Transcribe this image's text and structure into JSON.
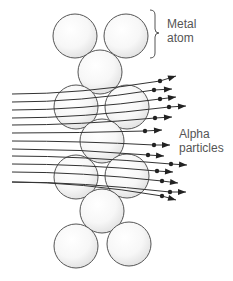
{
  "diagram": {
    "labels": {
      "metal_atom_line1": "Metal",
      "metal_atom_line2": "atom",
      "alpha_line1": "Alpha",
      "alpha_line2": "particles"
    },
    "colors": {
      "atom_stroke": "#555555",
      "atom_fill_light": "#ffffff",
      "atom_fill_shade": "#e6e6e6",
      "line": "#333333",
      "dot": "#222222",
      "text": "#555555"
    },
    "atoms": [
      {
        "cx": 75,
        "cy": 36,
        "r": 22
      },
      {
        "cx": 126,
        "cy": 36,
        "r": 22
      },
      {
        "cx": 100,
        "cy": 72,
        "r": 22
      },
      {
        "cx": 76,
        "cy": 107,
        "r": 22
      },
      {
        "cx": 127,
        "cy": 107,
        "r": 22
      },
      {
        "cx": 102,
        "cy": 141,
        "r": 22
      },
      {
        "cx": 76,
        "cy": 177,
        "r": 22
      },
      {
        "cx": 127,
        "cy": 176,
        "r": 22
      },
      {
        "cx": 102,
        "cy": 211,
        "r": 22
      },
      {
        "cx": 76,
        "cy": 246,
        "r": 22
      },
      {
        "cx": 129,
        "cy": 244,
        "r": 22
      }
    ],
    "particle_paths": [
      {
        "start_y": 94,
        "dot": [
          160,
          81
        ],
        "tip": [
          176,
          76
        ]
      },
      {
        "start_y": 102,
        "dot": [
          154,
          90
        ],
        "tip": [
          172,
          89
        ]
      },
      {
        "start_y": 110,
        "dot": [
          160,
          99
        ],
        "tip": [
          176,
          97
        ]
      },
      {
        "start_y": 118,
        "dot": [
          169,
          107
        ],
        "tip": [
          186,
          106
        ]
      },
      {
        "start_y": 125,
        "dot": [
          155,
          118
        ],
        "tip": [
          172,
          117
        ]
      },
      {
        "start_y": 133,
        "dot": [
          145,
          131
        ],
        "tip": [
          162,
          130
        ]
      },
      {
        "start_y": 141,
        "dot": [
          154,
          145
        ],
        "tip": [
          170,
          145
        ]
      },
      {
        "start_y": 149,
        "dot": [
          148,
          155
        ],
        "tip": [
          164,
          156
        ]
      },
      {
        "start_y": 156,
        "dot": [
          171,
          164
        ],
        "tip": [
          187,
          165
        ]
      },
      {
        "start_y": 164,
        "dot": [
          157,
          171
        ],
        "tip": [
          173,
          172
        ]
      },
      {
        "start_y": 172,
        "dot": [
          162,
          181
        ],
        "tip": [
          178,
          183
        ]
      },
      {
        "start_y": 182,
        "dot": [
          170,
          192
        ],
        "tip": [
          186,
          192
        ]
      },
      {
        "start_y": 182,
        "dot": [
          162,
          196
        ],
        "tip": [
          176,
          200
        ]
      }
    ],
    "path_start_x": 12
  }
}
